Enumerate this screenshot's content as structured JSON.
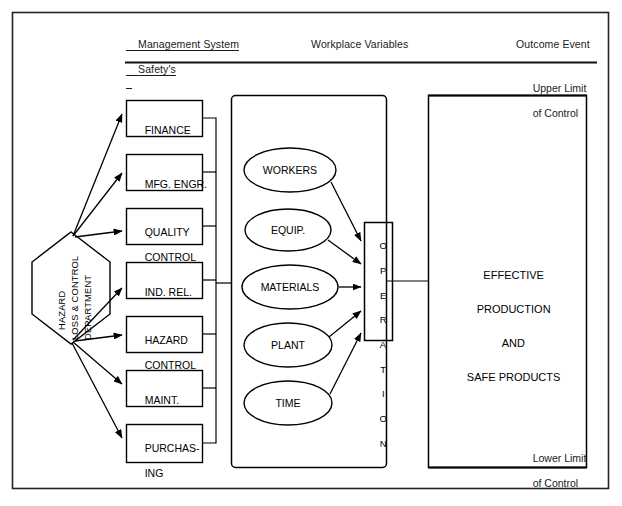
{
  "diagram": {
    "title_columns": [
      {
        "id": "management-system",
        "line1": "Management System",
        "line2": "Safety's"
      },
      {
        "id": "workplace-variables",
        "line1": "Workplace Variables",
        "line2": ""
      },
      {
        "id": "outcome-event",
        "line1": "Outcome Event",
        "line2": ""
      }
    ],
    "source_node": {
      "id": "hazard-loss-control-department",
      "lines": [
        "HAZARD",
        "LOSS & CONTROL",
        "DEPARTMENT"
      ]
    },
    "departments": [
      {
        "id": "finance",
        "line1": "FINANCE",
        "line2": ""
      },
      {
        "id": "mfg-engr",
        "line1": "MFG. ENGR.",
        "line2": ""
      },
      {
        "id": "quality-control",
        "line1": "QUALITY",
        "line2": "CONTROL"
      },
      {
        "id": "ind-rel",
        "line1": "IND. REL.",
        "line2": ""
      },
      {
        "id": "hazard-control",
        "line1": "HAZARD",
        "line2": "CONTROL"
      },
      {
        "id": "maint",
        "line1": "MAINT.",
        "line2": ""
      },
      {
        "id": "purchasing",
        "line1": "PURCHAS-",
        "line2": "ING"
      }
    ],
    "workplace_variables": [
      {
        "id": "workers",
        "label": "WORKERS"
      },
      {
        "id": "equipment",
        "label": "EQUIP."
      },
      {
        "id": "materials",
        "label": "MATERIALS"
      },
      {
        "id": "plant",
        "label": "PLANT"
      },
      {
        "id": "time",
        "label": "TIME"
      }
    ],
    "operation_node": {
      "id": "operation",
      "label": "OPERATION",
      "letters": [
        "O",
        "P",
        "E",
        "R",
        "A",
        "T",
        "I",
        "O",
        "N"
      ]
    },
    "outcome": {
      "id": "effective-production-safe-products",
      "lines": [
        "EFFECTIVE",
        "PRODUCTION",
        "AND",
        "SAFE PRODUCTS"
      ],
      "upper_limit": {
        "line1": "Upper Limit",
        "line2": "of Control"
      },
      "lower_limit": {
        "line1": "Lower Limit",
        "line2": "of Control"
      }
    },
    "colors": {
      "ink": "#000000",
      "paper": "#ffffff",
      "frame": "#222222"
    }
  }
}
